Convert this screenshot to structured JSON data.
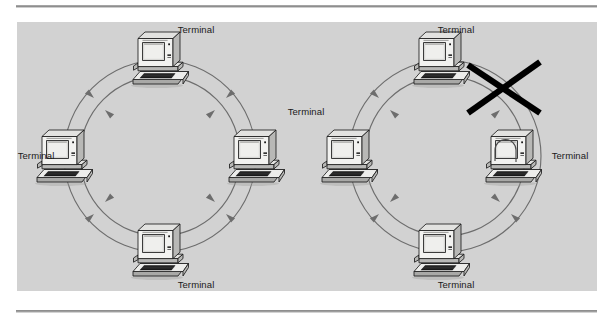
{
  "figure": {
    "caption_text": "",
    "background_color": "#ffffff",
    "panel_color": "#d2d2d2",
    "rule_color": "#8e8e8e",
    "line_color": "#6d6d6d",
    "break_color": "#000000",
    "label_text": "Terminal"
  },
  "diagrams": [
    {
      "id": "left-ring",
      "name": "intact-dual-ring",
      "center": {
        "x": 160,
        "y": 156
      },
      "radius_outer": 96,
      "radius_inner": 80,
      "has_break": false,
      "has_wrap": false,
      "nodes": [
        {
          "position": "top",
          "label": "Terminal",
          "label_x": 196,
          "label_y": 33,
          "node_x": 160,
          "node_y": 58
        },
        {
          "position": "right",
          "label": "Terminal",
          "label_x": 306,
          "label_y": 115,
          "node_x": 256,
          "node_y": 156
        },
        {
          "position": "bottom",
          "label": "Terminal",
          "label_x": 196,
          "label_y": 285,
          "node_x": 160,
          "node_y": 250
        },
        {
          "position": "left",
          "label": "Terminal",
          "label_x": 24,
          "label_y": 158,
          "node_x": 64,
          "node_y": 156
        }
      ]
    },
    {
      "id": "right-ring",
      "name": "broken-dual-ring-with-wrap",
      "center": {
        "x": 445,
        "y": 156
      },
      "radius_outer": 96,
      "radius_inner": 80,
      "has_break": true,
      "has_wrap": true,
      "break_label": "cable-break",
      "wrap_label": "loopback-wrap",
      "nodes": [
        {
          "position": "top",
          "label": "Terminal",
          "label_x": 431,
          "label_y": 33,
          "node_x": 441,
          "node_y": 58
        },
        {
          "position": "right",
          "label": "Terminal",
          "label_x": 546,
          "label_y": 158,
          "node_x": 513,
          "node_y": 156
        },
        {
          "position": "bottom",
          "label": "Terminal",
          "label_x": 431,
          "label_y": 285,
          "node_x": 441,
          "node_y": 250
        },
        {
          "position": "left",
          "label": "Terminal",
          "label_x": 0,
          "label_y": 0,
          "node_x": 374,
          "node_y": 156
        }
      ]
    }
  ],
  "labels": [
    {
      "key": "l_top",
      "text": "Terminal"
    },
    {
      "key": "l_right",
      "text": "Terminal"
    },
    {
      "key": "l_bottom",
      "text": "Terminal"
    },
    {
      "key": "l_left",
      "text": "Terminal"
    },
    {
      "key": "r_top",
      "text": "Terminal"
    },
    {
      "key": "r_right",
      "text": "Terminal"
    },
    {
      "key": "r_bottom",
      "text": "Terminal"
    }
  ],
  "icons": {
    "terminal": "computer-terminal-icon",
    "arrow": "flow-arrow-icon",
    "break": "x-break-icon",
    "wrap": "loopback-arc-icon"
  }
}
